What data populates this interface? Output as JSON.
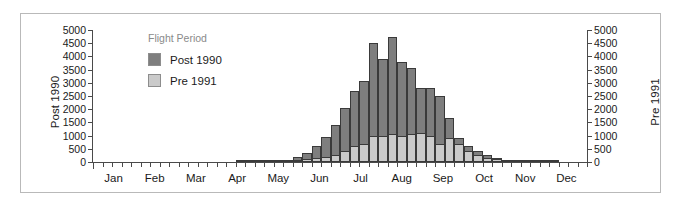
{
  "chart_data": {
    "type": "bar",
    "title": "",
    "xlabel": "",
    "ylabel": "Post 1990",
    "y2label": "Pre 1991",
    "ylim": [
      0,
      5000
    ],
    "y2lim": [
      0,
      5000
    ],
    "grid": false,
    "bar_mode": "overlaid",
    "legend": {
      "title": "Flight Period",
      "position": "top-left-inside",
      "entries": [
        {
          "name": "Post 1990",
          "color": "#7e7e7e"
        },
        {
          "name": "Pre 1991",
          "color": "#cacaca"
        }
      ]
    },
    "y_ticks": [
      0,
      500,
      1000,
      1500,
      2000,
      2500,
      3000,
      3500,
      4000,
      4500,
      5000
    ],
    "y_tick_labels": [
      "0",
      "500",
      "1000",
      "1500",
      "2000",
      "2500",
      "3000",
      "3500",
      "4000",
      "4500",
      "5000"
    ],
    "y2_ticks": [
      0,
      500,
      1000,
      1500,
      2000,
      2500,
      3000,
      3500,
      4000,
      4500,
      5000
    ],
    "y2_tick_labels": [
      "0",
      "500",
      "1000",
      "1500",
      "2000",
      "2500",
      "3000",
      "3500",
      "4000",
      "4500",
      "5000"
    ],
    "months": [
      "Jan",
      "Feb",
      "Mar",
      "Apr",
      "May",
      "Jun",
      "Jul",
      "Aug",
      "Sep",
      "Oct",
      "Nov",
      "Dec"
    ],
    "x_bin": "week",
    "x_bin_count": 52,
    "series": [
      {
        "name": "Post 1990",
        "color": "#7e7e7e",
        "values": [
          0,
          0,
          0,
          0,
          0,
          0,
          0,
          0,
          0,
          0,
          0,
          0,
          0,
          0,
          0,
          30,
          40,
          50,
          60,
          70,
          90,
          190,
          340,
          620,
          950,
          1400,
          2050,
          2700,
          3050,
          4500,
          3900,
          4750,
          3800,
          3550,
          2800,
          2800,
          2500,
          1650,
          900,
          620,
          400,
          250,
          160,
          90,
          60,
          40,
          25,
          15,
          10,
          0,
          0,
          0
        ]
      },
      {
        "name": "Pre 1991",
        "color": "#cacaca",
        "values": [
          0,
          0,
          0,
          0,
          0,
          0,
          0,
          0,
          0,
          0,
          0,
          0,
          0,
          0,
          0,
          20,
          25,
          30,
          35,
          40,
          50,
          70,
          110,
          160,
          200,
          260,
          420,
          620,
          700,
          980,
          1000,
          1050,
          1000,
          1050,
          1100,
          1000,
          700,
          900,
          700,
          420,
          270,
          170,
          110,
          70,
          45,
          30,
          20,
          12,
          8,
          0,
          0,
          0
        ]
      }
    ]
  }
}
